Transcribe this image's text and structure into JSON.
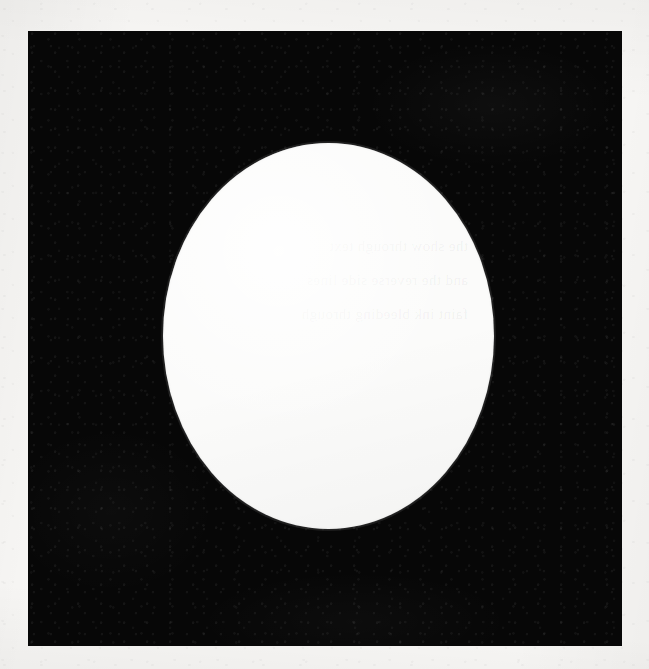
{
  "image": {
    "kind": "scanned-page-figure",
    "description": "Scanned book or document page showing a solid black rectangular field with a single large white ellipse centered slightly left of middle.",
    "width_px": 649,
    "height_px": 669
  },
  "page": {
    "paper_color": "#f7f6f4",
    "margin_left_px": 28,
    "margin_top_px": 31,
    "margin_right_px": 27,
    "margin_bottom_px": 23
  },
  "black_field": {
    "name": "black-rectangle",
    "fill_color": "#070707",
    "left_px": 28,
    "top_px": 31,
    "width_px": 594,
    "height_px": 615
  },
  "white_shape": {
    "name": "white-ellipse",
    "fill_color": "#fbfbfa",
    "center_x_px": 328,
    "center_y_px": 335,
    "radius_x_px": 165,
    "radius_y_px": 193,
    "left_px": 163,
    "top_px": 143,
    "right_px": 493,
    "bottom_px": 528
  },
  "artifacts": {
    "ghost_text_note": "Faint illegible show-through text from the reverse side of the sheet, visible only across the white ellipse.",
    "ghost_text_lines": "the   show   through   text\nand   the   reverse   side   lines\nfaint   ink   bleeding   through",
    "scan_noise": "fine grain speckle across the black ink field",
    "edge_softness": "slightly blurred ellipse boundary from scanning"
  },
  "captions": {
    "visible_text": "",
    "page_number": "",
    "figure_label": ""
  }
}
